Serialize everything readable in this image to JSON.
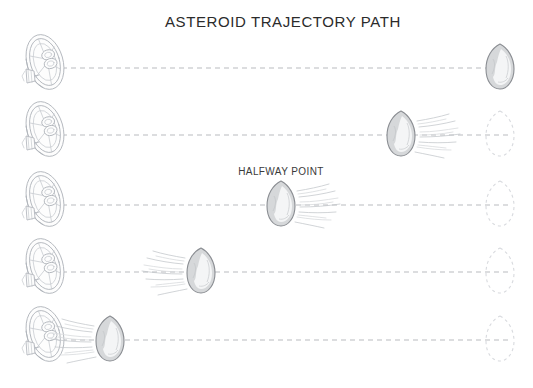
{
  "canvas": {
    "width": 533,
    "height": 388,
    "background": "#ffffff"
  },
  "title": {
    "text": "ASTEROID TRAJECTORY PATH",
    "x": 283,
    "y": 27,
    "color": "#2b2b2b"
  },
  "annotations": [
    {
      "id": "halfway-point",
      "text": "HALFWAY POINT",
      "x": 281,
      "y": 175,
      "color": "#3a3a3a"
    }
  ],
  "colors": {
    "trajectory_line": "#b9bcc0",
    "ghost_outline": "#d8dade",
    "dish_stroke": "#b0b4ba",
    "asteroid_body": "#d6d8da",
    "asteroid_stroke": "#8a8d92",
    "asteroid_highlight": "#f4f5f6",
    "trail": "#c2c5c9",
    "title_text": "#2b2b2b"
  },
  "layout": {
    "row_count": 5,
    "row_y_centers": [
      68,
      135,
      205,
      272,
      340
    ],
    "line_start_x": 62,
    "line_end_x": 512,
    "dish_x": 45,
    "target_x": 500
  },
  "rows": [
    {
      "index": 1,
      "label": "row-1",
      "y": 68,
      "dish": {
        "x": 45,
        "y": 62,
        "icon": "satellite-dish-icon"
      },
      "line": {
        "x1": 62,
        "x2": 512
      },
      "asteroid": {
        "x": 500,
        "y": 68,
        "trail": "none",
        "icon": "asteroid-icon"
      },
      "ghost": null
    },
    {
      "index": 2,
      "label": "row-2",
      "y": 135,
      "dish": {
        "x": 45,
        "y": 129,
        "icon": "satellite-dish-icon"
      },
      "line": {
        "x1": 62,
        "x2": 512
      },
      "asteroid": {
        "x": 401,
        "y": 135,
        "trail": "right",
        "icon": "asteroid-icon"
      },
      "ghost": {
        "x": 500,
        "y": 135,
        "icon": "asteroid-ghost-icon"
      }
    },
    {
      "index": 3,
      "label": "row-3",
      "y": 205,
      "dish": {
        "x": 45,
        "y": 199,
        "icon": "satellite-dish-icon"
      },
      "line": {
        "x1": 62,
        "x2": 512
      },
      "asteroid": {
        "x": 281,
        "y": 205,
        "trail": "right",
        "icon": "asteroid-icon"
      },
      "ghost": {
        "x": 500,
        "y": 205,
        "icon": "asteroid-ghost-icon"
      }
    },
    {
      "index": 4,
      "label": "row-4",
      "y": 272,
      "dish": {
        "x": 45,
        "y": 266,
        "icon": "satellite-dish-icon"
      },
      "line": {
        "x1": 62,
        "x2": 512
      },
      "asteroid": {
        "x": 201,
        "y": 272,
        "trail": "left",
        "icon": "asteroid-icon"
      },
      "ghost": {
        "x": 500,
        "y": 272,
        "icon": "asteroid-ghost-icon"
      }
    },
    {
      "index": 5,
      "label": "row-5",
      "y": 340,
      "dish": {
        "x": 45,
        "y": 334,
        "icon": "satellite-dish-icon"
      },
      "line": {
        "x1": 62,
        "x2": 512
      },
      "asteroid": {
        "x": 110,
        "y": 340,
        "trail": "left",
        "icon": "asteroid-icon"
      },
      "ghost": {
        "x": 500,
        "y": 340,
        "icon": "asteroid-ghost-icon"
      }
    }
  ]
}
